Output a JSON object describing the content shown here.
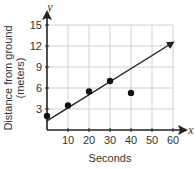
{
  "chart_data": {
    "type": "scatter",
    "title": "",
    "xlabel": "Seconds",
    "ylabel": "Distance from ground (meters)",
    "ylabel_lines": [
      "Distance from ground",
      "(meters)"
    ],
    "x_var": "x",
    "y_var": "y",
    "xlim": [
      0,
      60
    ],
    "ylim": [
      0,
      15
    ],
    "x_ticks": [
      10,
      20,
      30,
      40,
      50,
      60
    ],
    "y_ticks": [
      3,
      6,
      9,
      12,
      15
    ],
    "grid": true,
    "points": [
      {
        "x": 0,
        "y": 2
      },
      {
        "x": 10,
        "y": 3.5
      },
      {
        "x": 20,
        "y": 5.5
      },
      {
        "x": 30,
        "y": 7
      },
      {
        "x": 40,
        "y": 5.3
      }
    ],
    "trend_line": {
      "x1": 0,
      "y1": 1.3,
      "x2": 60,
      "y2": 12.5,
      "arrow_end": true
    }
  }
}
